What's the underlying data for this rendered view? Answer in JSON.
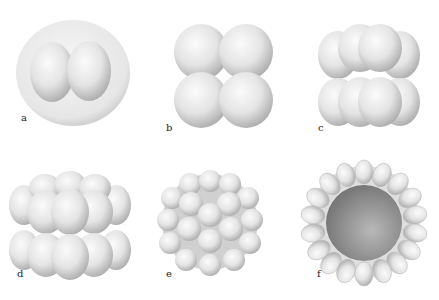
{
  "figure": {
    "panels": [
      {
        "id": "a",
        "label": "a",
        "description": "two-cell stage inside membrane"
      },
      {
        "id": "b",
        "label": "b",
        "description": "four-cell stage"
      },
      {
        "id": "c",
        "label": "c",
        "description": "eight-cell stage"
      },
      {
        "id": "d",
        "label": "d",
        "description": "sixteen-cell stage"
      },
      {
        "id": "e",
        "label": "e",
        "description": "morula"
      },
      {
        "id": "f",
        "label": "f",
        "description": "blastula cross-section"
      }
    ],
    "colors": {
      "cell_light": "#f4f4f4",
      "cell_shadow": "#b8b8b8",
      "cavity": "#8a8a8a",
      "background": "#ffffff"
    }
  }
}
